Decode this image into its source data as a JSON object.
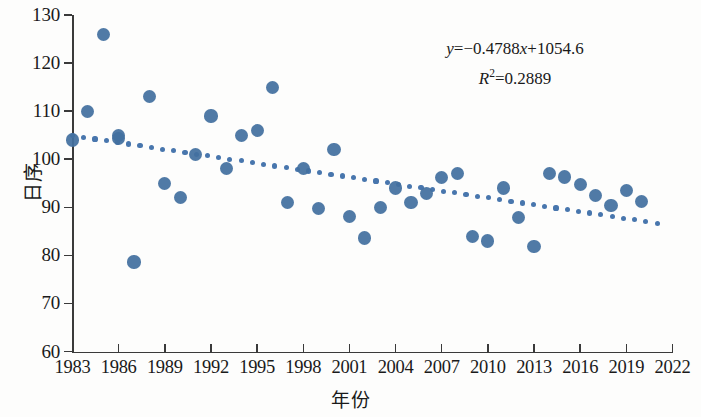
{
  "chart_data": {
    "type": "scatter",
    "title": "",
    "xlabel": "年份",
    "ylabel": "日序",
    "xlim": [
      1983,
      2022
    ],
    "ylim": [
      60,
      130
    ],
    "xticks": [
      1983,
      1986,
      1989,
      1992,
      1995,
      1998,
      2001,
      2004,
      2007,
      2010,
      2013,
      2016,
      2019,
      2022
    ],
    "yticks": [
      60,
      70,
      80,
      90,
      100,
      110,
      120,
      130
    ],
    "grid": false,
    "legend": null,
    "marker_color": "#43709f",
    "trendline_color": "#4876ad",
    "series": [
      {
        "name": "日序",
        "x": [
          1983,
          1984,
          1985,
          1986,
          1986,
          1987,
          1988,
          1989,
          1990,
          1991,
          1992,
          1993,
          1994,
          1995,
          1996,
          1997,
          1998,
          1999,
          2000,
          2001,
          2002,
          2003,
          2004,
          2005,
          2006,
          2007,
          2008,
          2009,
          2010,
          2011,
          2012,
          2013,
          2014,
          2015,
          2016,
          2017,
          2018,
          2019,
          2020
        ],
        "y": [
          104.0,
          110.0,
          126.0,
          105.0,
          104.3,
          78.6,
          113.0,
          95.0,
          92.0,
          101.0,
          109.0,
          98.0,
          105.0,
          106.0,
          115.0,
          91.0,
          98.0,
          89.7,
          102.0,
          88.0,
          83.6,
          90.0,
          94.0,
          91.0,
          92.8,
          96.2,
          97.0,
          84.0,
          83.0,
          94.0,
          87.8,
          81.8,
          97.0,
          96.3,
          94.8,
          92.5,
          90.3,
          93.5,
          91.2
        ]
      }
    ],
    "trendline": {
      "equation_y": "y=−0.4788x+1054.6",
      "equation_r2": "R2=0.2889",
      "slope": -0.4788,
      "intercept": 1054.6,
      "r_squared": 0.2889,
      "x_start": 1983,
      "x_end": 2021,
      "y_start": 104.9,
      "y_end": 86.7,
      "style": "dotted"
    }
  },
  "annotation": {
    "line1_prefix": "y",
    "line1_rest": "=−0.4788",
    "line1_x": "x",
    "line1_tail": "+1054.6",
    "line2_r": "R",
    "line2_sup": "2",
    "line2_rest": "=0.2889"
  },
  "axis_titles": {
    "x": "年份",
    "y": "日序"
  }
}
